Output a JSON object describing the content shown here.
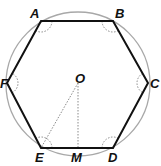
{
  "figure": {
    "colors": {
      "hexagon": "#111111",
      "circle": "#a8a8a8",
      "dotted": "#8a8a8a",
      "label": "#111111"
    },
    "circle": {
      "cx": 78,
      "cy": 84,
      "r": 72
    },
    "vertices": [
      {
        "name": "A",
        "x": 41,
        "y": 21,
        "lx": 30,
        "ly": 18
      },
      {
        "name": "B",
        "x": 113,
        "y": 21,
        "lx": 115,
        "ly": 18
      },
      {
        "name": "C",
        "x": 148,
        "y": 83,
        "lx": 150,
        "ly": 88
      },
      {
        "name": "D",
        "x": 113,
        "y": 148,
        "lx": 108,
        "ly": 162
      },
      {
        "name": "E",
        "x": 41,
        "y": 148,
        "lx": 35,
        "ly": 162
      },
      {
        "name": "F",
        "x": 7,
        "y": 83,
        "lx": 0,
        "ly": 88
      }
    ],
    "points": [
      {
        "name": "O",
        "x": 78,
        "y": 83,
        "lx": 75,
        "ly": 83
      },
      {
        "name": "M",
        "x": 78,
        "y": 148,
        "lx": 71,
        "ly": 162
      }
    ],
    "dotted_segments": [
      {
        "from": "O",
        "to": "E"
      },
      {
        "from": "O",
        "to": "M"
      }
    ],
    "angle_marks": [
      "A",
      "B",
      "C",
      "D",
      "E",
      "F"
    ]
  }
}
